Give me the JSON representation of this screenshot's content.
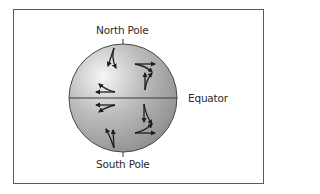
{
  "diagram": {
    "labels": {
      "north_pole": "North Pole",
      "south_pole": "South Pole",
      "equator": "Equator"
    },
    "colors": {
      "frame": "#5a5a5a",
      "sphere_light": "#f4f4f4",
      "sphere_mid": "#b8b8b8",
      "sphere_dark": "#8a8a8a",
      "arrow": "#1e1e1e",
      "text": "#2b2b2b"
    },
    "sphere": {
      "cx": 123,
      "cy": 98,
      "r": 54
    },
    "arrows": [
      {
        "hemisphere": "north",
        "side": "left",
        "position": "upper",
        "direction": "deflect-right"
      },
      {
        "hemisphere": "north",
        "side": "left",
        "position": "near-equator",
        "direction": "deflect-right"
      },
      {
        "hemisphere": "north",
        "side": "right",
        "position": "upper",
        "direction": "deflect-right"
      },
      {
        "hemisphere": "south",
        "side": "left",
        "position": "near-equator",
        "direction": "deflect-left"
      },
      {
        "hemisphere": "south",
        "side": "left",
        "position": "lower",
        "direction": "deflect-left"
      },
      {
        "hemisphere": "south",
        "side": "right",
        "position": "lower",
        "direction": "deflect-left"
      }
    ]
  }
}
